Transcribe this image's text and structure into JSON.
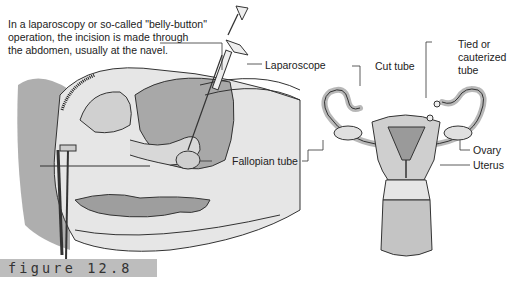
{
  "caption": {
    "lines": [
      "In a laparoscopy or so-called \"belly-button\"",
      "operation, the incision is made through",
      "the abdomen, usually at the navel."
    ]
  },
  "labels": {
    "laparoscope": "Laparoscope",
    "cut_tube": "Cut tube",
    "tied_tube": [
      "Tied or",
      "cauterized",
      "tube"
    ],
    "ovary": "Ovary",
    "uterus": "Uterus",
    "fallopian_tube": "Fallopian tube"
  },
  "figure_tag": "figure 12.8",
  "colors": {
    "line": "#333333",
    "tissue_light": "#e4e4e4",
    "tissue_mid": "#bdbdbd",
    "tissue_dark": "#8a8a8a",
    "tag_bg": "#bdbdbd"
  }
}
